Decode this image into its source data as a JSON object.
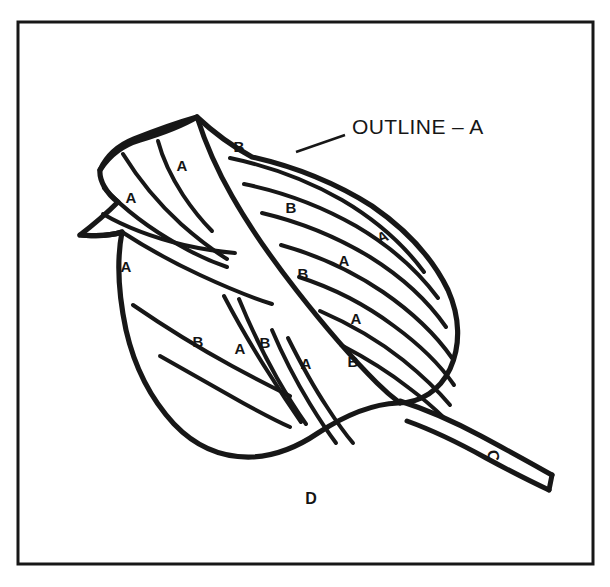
{
  "figure": {
    "background_color": "#ffffff",
    "ink_color": "#171717",
    "frame": {
      "name": "border-frame",
      "x": 18,
      "y": 22,
      "width": 575,
      "height": 542,
      "stroke_width": 3
    }
  },
  "callout": {
    "text": "OUTLINE – A",
    "x": 352,
    "y": 128,
    "leader": {
      "from_x": 345,
      "from_y": 135,
      "to_x": 296,
      "to_y": 152
    }
  },
  "region_labels": [
    {
      "key": "stem",
      "text": "C",
      "x": 492,
      "y": 456,
      "rotation": 78
    },
    {
      "key": "below-leaf",
      "text": "D",
      "x": 311,
      "y": 500,
      "rotation": 0
    }
  ],
  "vein_labels": [
    {
      "id": "a1",
      "text": "A",
      "x": 182,
      "y": 167,
      "rotation": 0
    },
    {
      "id": "a2",
      "text": "A",
      "x": 131,
      "y": 199,
      "rotation": 0
    },
    {
      "id": "a3",
      "text": "A",
      "x": 126,
      "y": 268,
      "rotation": 0
    },
    {
      "id": "b1",
      "text": "B",
      "x": 239,
      "y": 148,
      "rotation": 0
    },
    {
      "id": "b2",
      "text": "B",
      "x": 291,
      "y": 209,
      "rotation": 0
    },
    {
      "id": "a4",
      "text": "A",
      "x": 383,
      "y": 238,
      "rotation": -22
    },
    {
      "id": "a5",
      "text": "A",
      "x": 344,
      "y": 262,
      "rotation": 0
    },
    {
      "id": "b3",
      "text": "B",
      "x": 303,
      "y": 275,
      "rotation": 0
    },
    {
      "id": "a6",
      "text": "A",
      "x": 356,
      "y": 320,
      "rotation": 0
    },
    {
      "id": "b4",
      "text": "B",
      "x": 198,
      "y": 343,
      "rotation": 0
    },
    {
      "id": "a7",
      "text": "A",
      "x": 240,
      "y": 350,
      "rotation": 0
    },
    {
      "id": "b5",
      "text": "B",
      "x": 265,
      "y": 344,
      "rotation": 0
    },
    {
      "id": "a8",
      "text": "A",
      "x": 306,
      "y": 365,
      "rotation": 0
    },
    {
      "id": "b6",
      "text": "B",
      "x": 353,
      "y": 363,
      "rotation": 0
    }
  ],
  "geometry": {
    "leaf_outline": "M 197 117 C 214 133 232 146 252 157 C 292 166 334 182 372 206 C 404 228 432 257 448 290 C 460 317 461 345 450 369 C 440 390 421 403 398 403 C 372 404 344 416 318 433 C 296 448 275 456 252 457 C 222 458 195 446 174 424 C 150 398 134 365 126 330 C 118 292 117 258 122 232 C 104 238 88 235 80 235 C 93 225 106 214 118 202 C 106 193 99 180 100 170 C 107 155 119 145 134 139 C 154 131 176 123 197 117 Z",
    "leaf_left_lobe_upper": "M 100 170 C 109 156 123 145 140 140 C 160 134 180 127 197 117",
    "leaf_left_lobe_notch": "M 122 232 C 104 238 88 235 80 235",
    "midrib": "M 197 117 C 205 142 217 170 232 196 C 249 226 272 259 297 291 C 322 323 350 356 377 383 C 388 394 396 400 400 403",
    "veins_left_upper": [
      "M 158 141 C 163 160 172 178 183 195 C 193 210 203 222 212 231",
      "M 123 154 C 139 180 159 204 181 224 C 198 239 214 251 227 259",
      "M 104 188 C 126 211 152 230 179 245 C 198 256 215 263 227 267",
      "M 103 214 C 127 228 155 238 184 245 C 206 250 224 252 235 253"
    ],
    "veins_left_lower": [
      "M 122 232 C 145 247 172 262 200 275 C 228 288 253 298 272 304",
      "M 133 305 C 165 327 199 348 232 366 C 258 380 278 390 290 396",
      "M 160 356 C 188 372 216 388 243 403 C 265 415 281 423 290 427",
      "M 224 296 C 238 323 254 350 270 375 C 283 396 294 412 301 422",
      "M 239 299 C 250 326 263 353 277 378 C 289 399 299 414 306 424",
      "M 272 330 C 283 356 296 381 310 404 C 321 422 330 435 336 443",
      "M 288 338 C 300 362 313 386 327 407 C 338 424 347 436 353 443"
    ],
    "veins_right": [
      "M 230 158 C 268 166 307 180 342 200 C 376 220 404 245 424 272",
      "M 244 184 C 283 192 321 206 356 226 C 390 246 418 271 438 298",
      "M 262 213 C 300 222 337 237 370 257 C 402 277 428 301 446 327",
      "M 281 245 C 317 255 352 271 383 292 C 412 312 436 335 452 358",
      "M 299 277 C 333 288 366 305 394 326 C 420 345 441 366 454 385",
      "M 320 311 C 350 324 379 341 403 360 C 424 377 440 393 450 405",
      "M 341 345 C 366 358 390 373 409 388 C 425 400 436 410 443 417"
    ],
    "stem": [
      "M 400 401 C 425 409 453 421 481 436 C 509 451 534 465 552 475",
      "M 407 421 C 432 430 459 443 486 458 C 512 472 534 483 549 490",
      "M 549 490 L 552 475"
    ]
  }
}
